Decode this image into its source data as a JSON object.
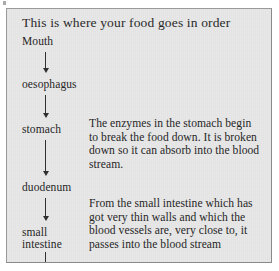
{
  "page": {
    "background_color": "#ffffff",
    "panel_color": "#e8e8e8",
    "border_color": "#8a8a8a",
    "text_color": "#262626"
  },
  "worksheet": {
    "title": "This is where your food goes in order",
    "flow": {
      "nodes": [
        {
          "label": "Mouth"
        },
        {
          "label": "oesophagus"
        },
        {
          "label": "stomach"
        },
        {
          "label": "duodenum"
        },
        {
          "label": "small\nintestine"
        },
        {
          "label": "large\nintestine"
        }
      ],
      "arrows": [
        {
          "from": "Mouth",
          "to": "oesophagus",
          "direction": "down"
        },
        {
          "from": "oesophagus",
          "to": "stomach",
          "direction": "down"
        },
        {
          "from": "stomach",
          "to": "duodenum",
          "direction": "down"
        },
        {
          "from": "duodenum",
          "to": "small intestine",
          "direction": "down"
        },
        {
          "from": "small intestine",
          "to": "large intestine",
          "direction": "down"
        }
      ]
    },
    "annotations": [
      {
        "attached_to": "stomach",
        "text": "The enzymes in the stomach begin to break the food down. It is broken down so it can absorb into the blood stream."
      },
      {
        "attached_to": "small intestine",
        "text": "From the small intestine which has got very thin walls and which the blood vessels are, very close to, it passes into the blood stream"
      }
    ]
  }
}
